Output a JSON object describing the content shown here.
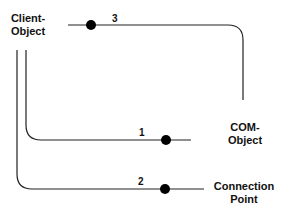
{
  "nodes": {
    "client": {
      "line1": "Client-",
      "line2": "Object"
    },
    "com": {
      "line1": "COM-",
      "line2": "Object"
    },
    "connection": {
      "line1": "Connection",
      "line2": "Point"
    }
  },
  "connections": [
    {
      "label": "1",
      "from": "Client-Object",
      "to": "COM-Object"
    },
    {
      "label": "2",
      "from": "Client-Object",
      "to": "Connection Point"
    },
    {
      "label": "3",
      "from": "Client-Object",
      "to": "COM-Object"
    }
  ],
  "colors": {
    "line": "#222222",
    "text": "#111111"
  }
}
